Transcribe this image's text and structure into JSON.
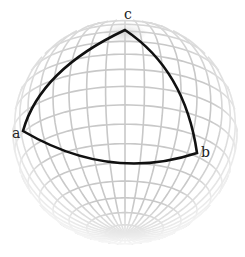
{
  "diagram": {
    "sphere": {
      "cx": 125,
      "cy": 132,
      "r": 112,
      "tilt_deg": 24,
      "meridians": 36,
      "parallel_step_deg": 10
    },
    "colors": {
      "grid": "#c8c8c8",
      "triangle": "#111111",
      "background": "#ffffff",
      "label": "#222222"
    },
    "vertices": [
      {
        "id": "c",
        "label": "c",
        "x": 125,
        "y": 30,
        "label_x": 124,
        "label_y": 19
      },
      {
        "id": "a",
        "label": "a",
        "x": 23,
        "y": 131,
        "label_x": 12,
        "label_y": 138
      },
      {
        "id": "b",
        "label": "b",
        "x": 197,
        "y": 153,
        "label_x": 201,
        "label_y": 157
      }
    ]
  }
}
